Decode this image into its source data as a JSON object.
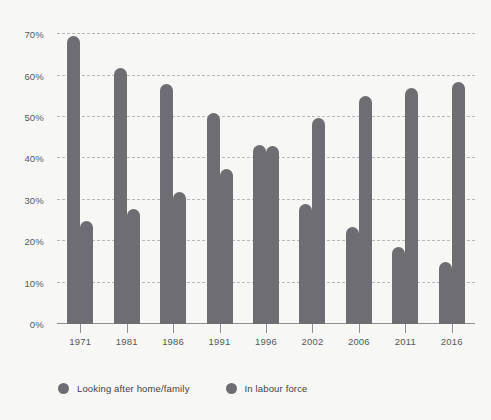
{
  "chart_data": {
    "type": "bar",
    "title": "",
    "subtitle": "",
    "xlabel": "",
    "ylabel": "",
    "ylim": [
      0,
      72
    ],
    "yticks": [
      0,
      10,
      20,
      30,
      40,
      50,
      60,
      70
    ],
    "ytick_labels": [
      "0%",
      "10%",
      "20%",
      "30%",
      "40%",
      "50%",
      "60%",
      "70%"
    ],
    "grid": true,
    "legend_position": "bottom-left",
    "categories": [
      "1971",
      "1981",
      "1986",
      "1991",
      "1996",
      "2002",
      "2006",
      "2011",
      "2016"
    ],
    "series": [
      {
        "name": "Looking after home/family",
        "color": "#6e6e72",
        "values": [
          69.5,
          61.8,
          58.0,
          51.0,
          43.2,
          29.0,
          23.5,
          18.5,
          15.0
        ]
      },
      {
        "name": "In labour force",
        "color": "#6e6e72",
        "values": [
          24.8,
          27.7,
          32.0,
          37.5,
          43.0,
          49.8,
          55.0,
          57.0,
          58.5
        ]
      }
    ]
  },
  "legend": {
    "items": [
      {
        "label": "Looking after home/family"
      },
      {
        "label": "In labour force"
      }
    ]
  },
  "colors": {
    "background": "#f7f7f5",
    "bar": "#6e6e72",
    "gridline": "#b9b9bd",
    "axis": "#8d8d92",
    "tick_text": "#58585c",
    "legend_text": "#3f3f44"
  }
}
